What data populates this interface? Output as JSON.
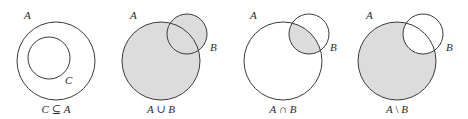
{
  "colors": {
    "stroke": "#3a3a3a",
    "fill": "#dcdcdc",
    "background": "#ffffff"
  },
  "panels": [
    {
      "id": "subset",
      "caption": {
        "left": "C",
        "op": " ⊆ ",
        "right": "A"
      },
      "labels": {
        "outer": "A",
        "inner": "C"
      }
    },
    {
      "id": "union",
      "caption": {
        "left": "A",
        "op": " ∪ ",
        "right": "B"
      },
      "labels": {
        "a": "A",
        "b": "B"
      }
    },
    {
      "id": "intersection",
      "caption": {
        "left": "A",
        "op": " ∩ ",
        "right": "B"
      },
      "labels": {
        "a": "A",
        "b": "B"
      }
    },
    {
      "id": "difference",
      "caption": {
        "left": "A",
        "op": " \\ ",
        "right": "B"
      },
      "labels": {
        "a": "A",
        "b": "B"
      }
    }
  ]
}
